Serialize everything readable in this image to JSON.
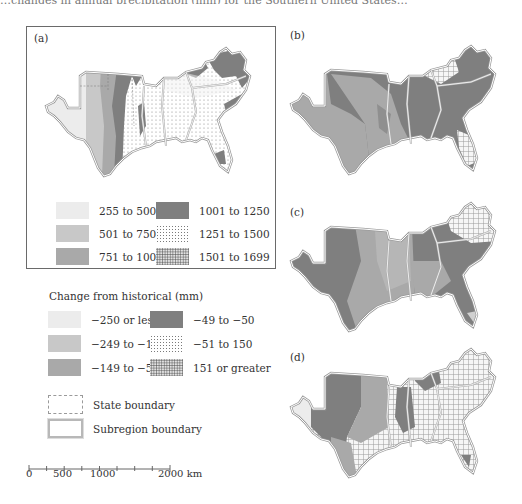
{
  "caption_fragment": "…changes in annual precipitation (mm) for the Southern United States…",
  "panels": {
    "a": {
      "label": "(a)"
    },
    "b": {
      "label": "(b)"
    },
    "c": {
      "label": "(c)"
    },
    "d": {
      "label": "(d)"
    }
  },
  "legend_historical": {
    "items": [
      {
        "label": "255 to 500",
        "pattern": "very-light",
        "color": "#ececec"
      },
      {
        "label": "501 to 750",
        "pattern": "light",
        "color": "#c8c8c8"
      },
      {
        "label": "751 to 1000",
        "pattern": "medium",
        "color": "#a9a9a9"
      },
      {
        "label": "1001 to 1250",
        "pattern": "dark",
        "color": "#7f7f7f"
      },
      {
        "label": "1251 to 1500",
        "pattern": "sparse-dots",
        "color": "#ffffff"
      },
      {
        "label": "1501 to 1699",
        "pattern": "dense-dots",
        "color": "#e2e2e2"
      }
    ]
  },
  "legend_change": {
    "title": "Change from historical (mm)",
    "items": [
      {
        "label": "−250 or less",
        "pattern": "very-light"
      },
      {
        "label": "−249 to −150",
        "pattern": "light"
      },
      {
        "label": "−149 to −50",
        "pattern": "medium"
      },
      {
        "label": "−49 to −50",
        "pattern": "dark"
      },
      {
        "label": "−51 to 150",
        "pattern": "sparse-dots"
      },
      {
        "label": "151 or greater",
        "pattern": "dense-dots"
      }
    ]
  },
  "boundaries": {
    "state": "State boundary",
    "subregion": "Subregion boundary"
  },
  "scale_bar": {
    "ticks": [
      "0",
      "500",
      "1000",
      "2000 km"
    ]
  }
}
